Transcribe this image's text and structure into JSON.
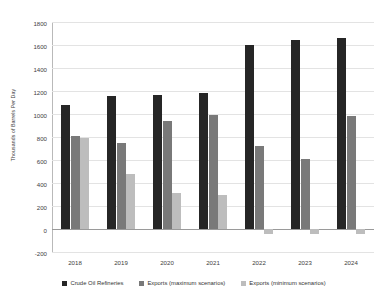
{
  "chart_data": {
    "type": "bar",
    "title": "",
    "subtitle": "",
    "xlabel": "",
    "ylabel": "Thousands of Barrels Per Day",
    "categories": [
      "2018",
      "2019",
      "2020",
      "2021",
      "2022",
      "2023",
      "2024"
    ],
    "series": [
      {
        "name": "Crude Oil Refineries",
        "color": "#262626",
        "values": [
          1080,
          1155,
          1165,
          1185,
          1600,
          1645,
          1660
        ]
      },
      {
        "name": "Exports (maximum scenarios)",
        "color": "#797979",
        "values": [
          805,
          745,
          940,
          995,
          720,
          610,
          985
        ]
      },
      {
        "name": "Exports (minimum scenarios)",
        "color": "#bdbdbd",
        "values": [
          790,
          480,
          310,
          300,
          -40,
          -40,
          -40
        ]
      }
    ],
    "ylim": [
      -200,
      1800
    ],
    "yticks": [
      -200,
      0,
      200,
      400,
      600,
      800,
      1000,
      1200,
      1400,
      1600,
      1800
    ],
    "ytick_labels": [
      "-200",
      "0",
      "200",
      "400",
      "600",
      "800",
      "1000",
      "1200",
      "1400",
      "1600",
      "1800"
    ],
    "grid": true,
    "legend_position": "bottom"
  }
}
